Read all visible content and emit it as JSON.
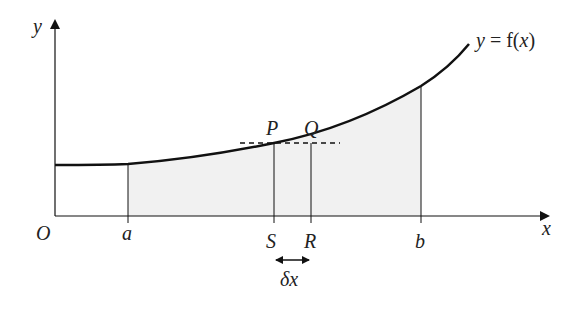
{
  "diagram": {
    "curve_label_y": "y",
    "curve_label_eq": " = f(",
    "curve_label_x": "x",
    "curve_label_close": ")",
    "axis_y_label": "y",
    "axis_x_label": "x",
    "origin_label": "O",
    "points": {
      "a": "a",
      "b": "b",
      "S": "S",
      "R": "R",
      "P": "P",
      "Q": "Q"
    },
    "delta_label": "δx",
    "colors": {
      "shade": "#f2f2f2",
      "stroke": "#111111"
    }
  }
}
